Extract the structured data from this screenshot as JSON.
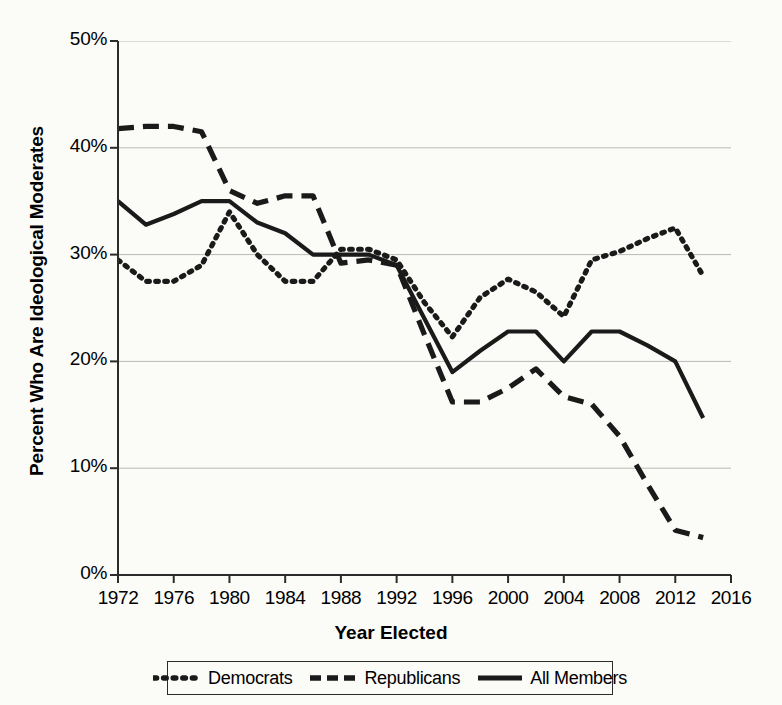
{
  "chart_data": {
    "type": "line",
    "title": "",
    "xlabel": "Year Elected",
    "ylabel": "Percent Who Are Ideological Moderates",
    "xlim": [
      1972,
      2016
    ],
    "ylim": [
      0,
      50
    ],
    "xticks": [
      "1972",
      "1976",
      "1980",
      "1984",
      "1988",
      "1992",
      "1996",
      "2000",
      "2004",
      "2008",
      "2012",
      "2016"
    ],
    "yticks": [
      "0%",
      "10%",
      "20%",
      "30%",
      "40%",
      "50%"
    ],
    "grid": "horizontal",
    "legend_position": "bottom",
    "x": [
      1972,
      1974,
      1976,
      1978,
      1980,
      1982,
      1984,
      1986,
      1988,
      1990,
      1992,
      1994,
      1996,
      1998,
      2000,
      2002,
      2004,
      2006,
      2008,
      2010,
      2012,
      2014
    ],
    "series": [
      {
        "name": "Democrats",
        "style": "dotted",
        "color": "#1a1a1a",
        "values": [
          29.5,
          27.5,
          27.5,
          29.0,
          34.0,
          30.0,
          27.5,
          27.5,
          30.5,
          30.5,
          29.5,
          25.5,
          22.3,
          26.0,
          27.7,
          26.5,
          24.2,
          29.5,
          30.3,
          31.5,
          32.5,
          28.0
        ]
      },
      {
        "name": "Republicans",
        "style": "dashed",
        "color": "#1a1a1a",
        "values": [
          41.8,
          42.0,
          42.0,
          41.5,
          36.0,
          34.8,
          35.5,
          35.5,
          29.2,
          29.5,
          29.0,
          22.5,
          16.2,
          16.2,
          17.5,
          19.3,
          16.7,
          16.0,
          13.0,
          8.5,
          4.2,
          3.5
        ]
      },
      {
        "name": "All Members",
        "style": "solid",
        "color": "#1a1a1a",
        "values": [
          35.0,
          32.8,
          33.8,
          35.0,
          35.0,
          33.0,
          32.0,
          30.0,
          30.0,
          30.0,
          29.0,
          24.0,
          19.0,
          21.0,
          22.8,
          22.8,
          20.0,
          22.8,
          22.8,
          21.5,
          20.0,
          14.7
        ]
      }
    ]
  },
  "legend": {
    "items": [
      {
        "label": "Democrats",
        "style": "dotted"
      },
      {
        "label": "Republicans",
        "style": "dashed"
      },
      {
        "label": "All Members",
        "style": "solid"
      }
    ]
  }
}
